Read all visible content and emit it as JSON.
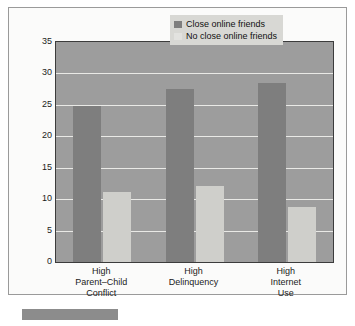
{
  "chart_data": {
    "type": "bar",
    "title": "",
    "xlabel": "",
    "ylabel": "Percentage of Youths",
    "ylim": [
      0,
      35
    ],
    "ytick_step": 5,
    "yticks": [
      35,
      30,
      25,
      20,
      15,
      10,
      5,
      0
    ],
    "grid": true,
    "legend_position": "top-right",
    "categories": [
      "High\nParent–Child\nConflict",
      "High\nDelinquency",
      "High\nInternet\nUse"
    ],
    "category_lines": [
      [
        "High",
        "Parent–Child",
        "Conflict"
      ],
      [
        "High",
        "Delinquency"
      ],
      [
        "High",
        "Internet",
        "Use"
      ]
    ],
    "series": [
      {
        "name": "Close online friends",
        "color": "#7e7e7e",
        "values": [
          24.8,
          27.5,
          28.5
        ]
      },
      {
        "name": "No close online friends",
        "color": "#cfcfcb",
        "values": [
          11.2,
          12.1,
          8.7
        ]
      }
    ]
  },
  "figure": {
    "plot_background": "#9d9d9d",
    "gridline_color": "#e9e9e6",
    "frame_color": "#9a9a9a",
    "axis_color": "#3c3c3c"
  },
  "caption_bar": {
    "label": ""
  }
}
